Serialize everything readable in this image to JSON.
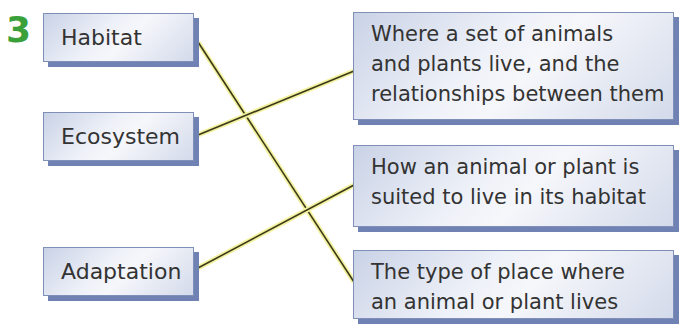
{
  "question_number": "3",
  "terms": [
    "Habitat",
    "Ecosystem",
    "Adaptation"
  ],
  "definitions": [
    [
      "Where a set of animals",
      "and plants live, and the",
      "relationships between them"
    ],
    [
      "How an animal or plant is",
      "suited to live in its habitat"
    ],
    [
      "The type of place where",
      "an animal or plant lives"
    ]
  ],
  "matches": [
    {
      "term": "Habitat",
      "definition_index": 2
    },
    {
      "term": "Ecosystem",
      "definition_index": 0
    },
    {
      "term": "Adaptation",
      "definition_index": 1
    }
  ],
  "colors": {
    "question_number": "#3aa03a",
    "line": "#3a3a1a",
    "line_glow": "#f4f2a0",
    "box_border": "#7f8fb8",
    "box_shadow": "#6f82b3"
  }
}
